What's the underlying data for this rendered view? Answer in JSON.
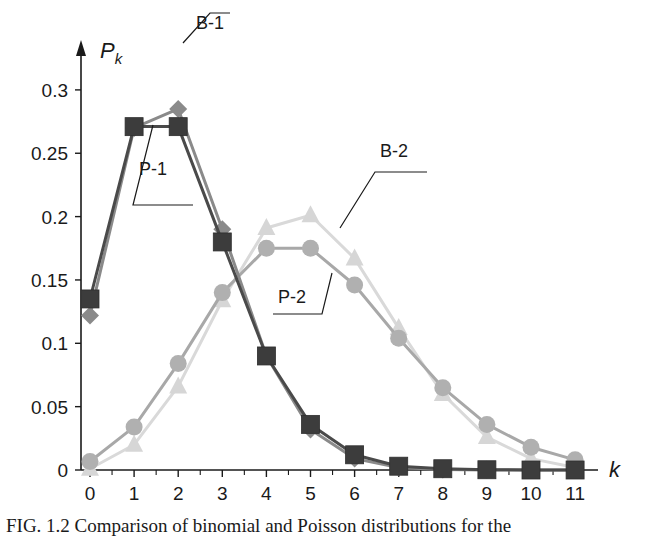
{
  "chart_data": {
    "type": "line",
    "title": "",
    "xlabel": "k",
    "ylabel": "P_k",
    "x": [
      0,
      1,
      2,
      3,
      4,
      5,
      6,
      7,
      8,
      9,
      10,
      11
    ],
    "xticks": [
      "0",
      "1",
      "2",
      "3",
      "4",
      "5",
      "6",
      "7",
      "8",
      "9",
      "10",
      "11"
    ],
    "yticks": [
      "0",
      "0.05",
      "0.1",
      "0.15",
      "0.2",
      "0.25",
      "0.3"
    ],
    "ylim": [
      0,
      0.3
    ],
    "xlim": [
      0,
      11
    ],
    "grid": false,
    "legend_position": "callout labels",
    "series": [
      {
        "name": "B-1",
        "marker": "diamond",
        "color": "#8a8a8a",
        "line_color": "#8a8a8a",
        "values": [
          0.122,
          0.27,
          0.285,
          0.19,
          0.09,
          0.032,
          0.009,
          0.002,
          0.0004,
          0.0001,
          0.0,
          0.0
        ]
      },
      {
        "name": "P-1",
        "marker": "square",
        "color": "#3c3c3c",
        "line_color": "#4a4a4a",
        "values": [
          0.135,
          0.271,
          0.271,
          0.18,
          0.09,
          0.036,
          0.012,
          0.003,
          0.001,
          0.0002,
          0.0,
          0.0
        ]
      },
      {
        "name": "B-2",
        "marker": "triangle",
        "color": "#d6d6d6",
        "line_color": "#d9d9d9",
        "values": [
          0.001,
          0.02,
          0.066,
          0.134,
          0.191,
          0.201,
          0.167,
          0.112,
          0.06,
          0.026,
          0.009,
          0.002
        ]
      },
      {
        "name": "P-2",
        "marker": "circle",
        "color": "#b0b0b0",
        "line_color": "#a8a8a8",
        "values": [
          0.0067,
          0.034,
          0.084,
          0.14,
          0.175,
          0.175,
          0.146,
          0.104,
          0.065,
          0.036,
          0.018,
          0.008
        ]
      }
    ],
    "annotations": [
      "B-1",
      "P-1",
      "B-2",
      "P-2"
    ]
  },
  "labels": {
    "y_axis_title": "P",
    "y_axis_sub": "k",
    "x_axis_title": "k",
    "callout_b1": "B-1",
    "callout_p1": "P-1",
    "callout_b2": "B-2",
    "callout_p2": "P-2"
  },
  "caption": "FIG. 1.2  Comparison of binomial and Poisson distributions for the"
}
